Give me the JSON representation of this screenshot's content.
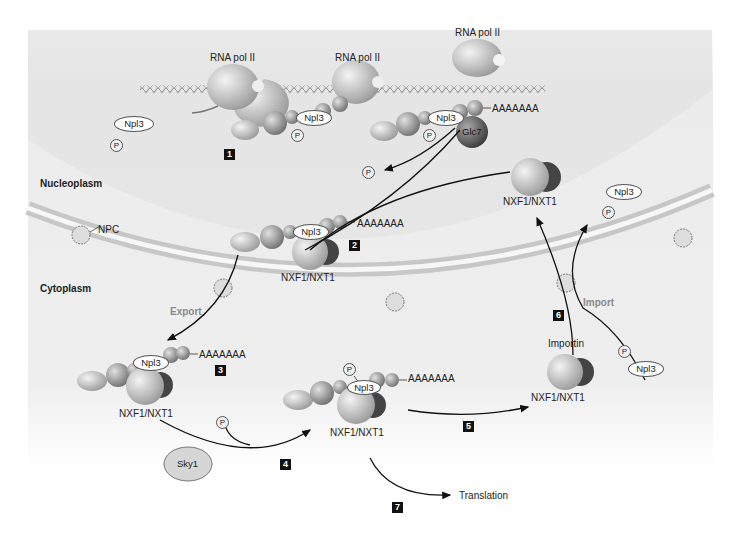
{
  "diagram": {
    "type": "mRNA nuclear export pathway",
    "compartments": {
      "nucleoplasm": "Nucleoplasm",
      "cytoplasm": "Cytoplasm"
    },
    "labels": {
      "rna_pol_1": "RNA pol II",
      "rna_pol_2": "RNA pol II",
      "rna_pol_3": "RNA pol II",
      "npc": "NPC",
      "export": "Export",
      "import": "Import",
      "importin": "Importin",
      "translation": "Translation",
      "polyA": "AAAAAAA",
      "npl3": "Npl3",
      "phosphate": "P",
      "glc7": "Glc7",
      "sky1": "Sky1",
      "nxf1_nxt1": "NXF1/NXT1"
    },
    "steps": [
      "1",
      "2",
      "3",
      "4",
      "5",
      "6",
      "7"
    ]
  },
  "colors": {
    "nucleus_bg": "#e6e6e6",
    "cytoplasm_bg": "#f1f1f1",
    "membrane": "#c9c9c9",
    "protein_light": "#c8c8c8",
    "protein_dark": "#555555",
    "step_box": "#111111"
  }
}
